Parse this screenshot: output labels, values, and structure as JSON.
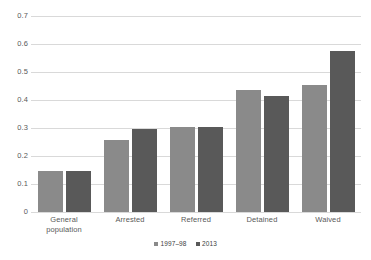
{
  "chart_data": {
    "type": "bar",
    "title": "",
    "subtitle": "",
    "xlabel": "",
    "ylabel": "",
    "categories": [
      "General\npopulation",
      "Arrested",
      "Referred",
      "Detained",
      "Waived"
    ],
    "series": [
      {
        "name": "1997–98",
        "color": "#8a8a8a",
        "values": [
          0.148,
          0.258,
          0.305,
          0.435,
          0.452
        ]
      },
      {
        "name": "2013",
        "color": "#595959",
        "values": [
          0.148,
          0.297,
          0.305,
          0.415,
          0.575
        ]
      }
    ],
    "ylim": [
      0,
      0.7
    ],
    "yticks": [
      "0",
      "0.1",
      "0.2",
      "0.3",
      "0.4",
      "0.5",
      "0.6",
      "0.7"
    ],
    "ytick_values": [
      0,
      0.1,
      0.2,
      0.3,
      0.4,
      0.5,
      0.6,
      0.7
    ],
    "grid": true,
    "grid_color": "#d9d9d9",
    "legend_position": "bottom-center",
    "background": "#ffffff"
  }
}
